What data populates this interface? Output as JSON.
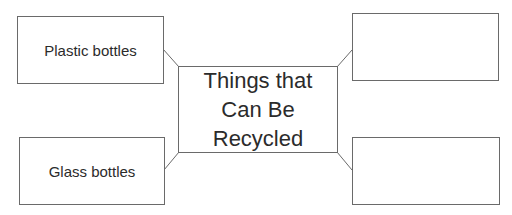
{
  "diagram": {
    "center": {
      "label": "Things that Can Be Recycled"
    },
    "nodes": [
      {
        "position": "top-left",
        "label": "Plastic bottles"
      },
      {
        "position": "top-right",
        "label": ""
      },
      {
        "position": "bottom-left",
        "label": "Glass bottles"
      },
      {
        "position": "bottom-right",
        "label": ""
      }
    ],
    "colors": {
      "border": "#6a6a6a",
      "text": "#2b2b2b",
      "background": "#ffffff"
    }
  }
}
